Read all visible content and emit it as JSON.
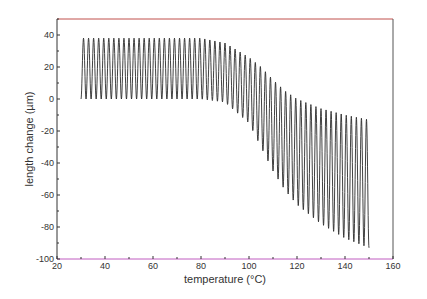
{
  "chart_data": {
    "type": "line",
    "title": "",
    "xlabel": "temperature (°C)",
    "ylabel": "length change (µm)",
    "xlim": [
      20,
      160
    ],
    "ylim": [
      -100,
      50
    ],
    "xticks": [
      20,
      40,
      60,
      80,
      100,
      120,
      140,
      160
    ],
    "yticks": [
      -100,
      -80,
      -60,
      -40,
      -20,
      0,
      20,
      40
    ],
    "grid": false,
    "legend": null,
    "series": [
      {
        "name": "length change oscillation",
        "color": "#2b2b2b",
        "description": "oscillating length change (~57 cycles) between upper and lower envelopes from 30 to 150 °C",
        "cycles": 57,
        "x_start": 30,
        "x_end": 150,
        "upper_envelope": {
          "x": [
            30,
            80,
            90,
            100,
            105,
            110,
            115,
            120,
            130,
            140,
            150
          ],
          "y": [
            38,
            38,
            35,
            26,
            20,
            12,
            5,
            0,
            -6,
            -10,
            -13
          ]
        },
        "lower_envelope": {
          "x": [
            30,
            80,
            90,
            100,
            105,
            110,
            115,
            120,
            130,
            140,
            150
          ],
          "y": [
            0,
            0,
            -2,
            -15,
            -30,
            -45,
            -57,
            -66,
            -78,
            -87,
            -93
          ]
        }
      }
    ],
    "frame_colors": {
      "top": "#c0504d",
      "bottom": "#c05cc0",
      "left": "#333333",
      "right": "#555555"
    }
  }
}
